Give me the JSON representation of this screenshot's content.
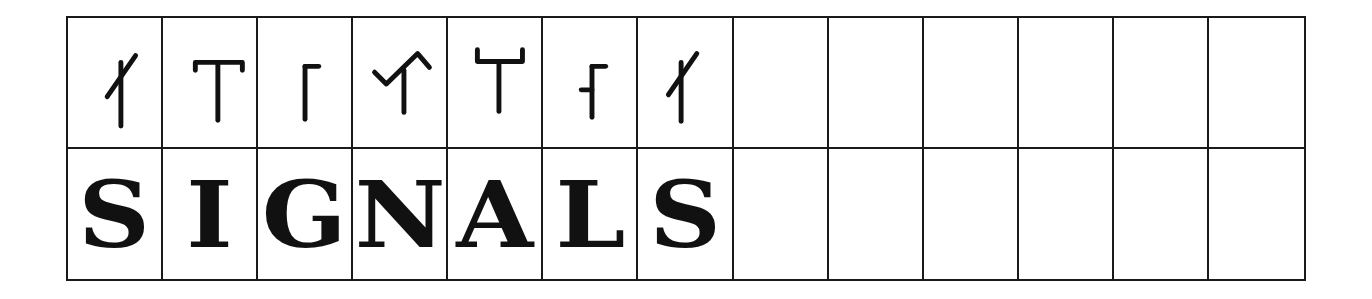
{
  "puzzle": {
    "columns": 13,
    "cipher_row": [
      {
        "symbol": "diagonal-tick",
        "paths": [
          "M54 44 L54 109",
          "M40 79 L69 37"
        ]
      },
      {
        "symbol": "t-bar",
        "paths": [
          "M33 52 L33 44 L81 44 L81 52",
          "M56 44 L56 103"
        ]
      },
      {
        "symbol": "gamma",
        "paths": [
          "M48 48 L48 102",
          "M48 48 L62 48"
        ]
      },
      {
        "symbol": "check-stem",
        "paths": [
          "M22 54 L34 66 L66 35 L78 49",
          "M52 52 L52 95"
        ]
      },
      {
        "symbol": "cup-stem",
        "paths": [
          "M30 31 L30 43 L76 43 L76 31",
          "M52 43 L52 94"
        ]
      },
      {
        "symbol": "gamma-stub",
        "paths": [
          "M50 48 L50 100",
          "M50 48 L64 48",
          "M39 72 L50 72"
        ]
      },
      {
        "symbol": "diagonal-tick",
        "paths": [
          "M44 44 L44 104",
          "M31 77 L60 35"
        ]
      },
      {
        "symbol": "",
        "paths": []
      },
      {
        "symbol": "",
        "paths": []
      },
      {
        "symbol": "",
        "paths": []
      },
      {
        "symbol": "",
        "paths": []
      },
      {
        "symbol": "",
        "paths": []
      },
      {
        "symbol": "",
        "paths": []
      }
    ],
    "answer_row": [
      "S",
      "I",
      "G",
      "N",
      "A",
      "L",
      "S",
      "",
      "",
      "",
      "",
      "",
      ""
    ],
    "colors": {
      "ink": "#111111",
      "grid": "#1a1a1a",
      "background": "#ffffff"
    }
  }
}
